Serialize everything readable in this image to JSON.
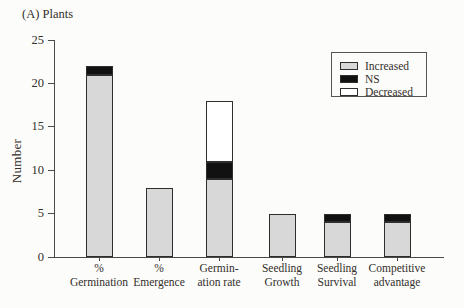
{
  "chart_data": {
    "type": "bar",
    "stacked": true,
    "title": "(A) Plants",
    "xlabel": "",
    "ylabel": "Number",
    "ylim": [
      0,
      25
    ],
    "yticks": [
      0,
      5,
      10,
      15,
      20,
      25
    ],
    "grid": false,
    "legend": {
      "position": "top-right",
      "entries": [
        "Increased",
        "NS",
        "Decreased"
      ]
    },
    "categories": [
      "% Germination",
      "% Emergence",
      "Germin-ation rate",
      "Seedling Growth",
      "Seedling Survival",
      "Competitive advantage"
    ],
    "category_label_lines": [
      [
        "%",
        "Germination"
      ],
      [
        "%",
        "Emergence"
      ],
      [
        "Germin-",
        "ation rate"
      ],
      [
        "Seedling",
        "Growth"
      ],
      [
        "Seedling",
        "Survival"
      ],
      [
        "Competitive",
        "advantage"
      ]
    ],
    "series": [
      {
        "name": "Increased",
        "color": "#d8d8d8",
        "values": [
          21,
          8,
          9,
          5,
          4,
          4
        ]
      },
      {
        "name": "NS",
        "color": "#111111",
        "values": [
          1,
          0,
          2,
          0,
          1,
          1
        ]
      },
      {
        "name": "Decreased",
        "color": "#ffffff",
        "values": [
          0,
          0,
          7,
          0,
          0,
          0
        ]
      }
    ],
    "bar_totals": [
      22,
      8,
      18,
      5,
      5,
      5
    ]
  },
  "colors": {
    "increased": "#d8d8d8",
    "ns": "#111111",
    "decreased": "#ffffff",
    "axis": "#4a4a4a",
    "bar_border": "#2e2e2e",
    "background": "#fcfcfa"
  }
}
